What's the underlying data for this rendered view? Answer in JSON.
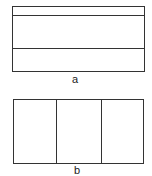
{
  "figures": [
    {
      "id": "a",
      "label": "a",
      "orientation": "horizontal-strips",
      "divisions": 3
    },
    {
      "id": "b",
      "label": "b",
      "orientation": "vertical-strips",
      "divisions": 3
    }
  ]
}
